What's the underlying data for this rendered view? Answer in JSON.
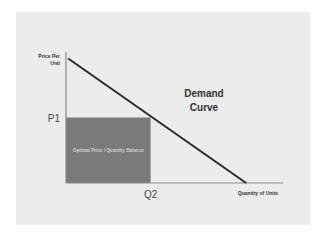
{
  "chart_data": {
    "type": "line",
    "title": "",
    "xlabel": "Quantity of Units",
    "ylabel": [
      "Price Per",
      "Unit"
    ],
    "xlim": [
      0,
      1
    ],
    "ylim": [
      0,
      1
    ],
    "grid": false,
    "series": [
      {
        "name": "Demand Curve",
        "points": [
          [
            0.01,
            0.95
          ],
          [
            0.83,
            0.0
          ]
        ]
      }
    ],
    "annotations": {
      "curve_label": [
        "Demand",
        "Curve"
      ],
      "p1_label": "P1",
      "q2_label": "Q2",
      "p1_value": 0.5,
      "q2_value": 0.39,
      "region_label": "Optimal Price / Quantity Balance"
    },
    "colors": {
      "background": "#ececec",
      "curve": "#2a2a2a",
      "axis": "#8a8a8a",
      "region": "#7a7a7a"
    }
  }
}
